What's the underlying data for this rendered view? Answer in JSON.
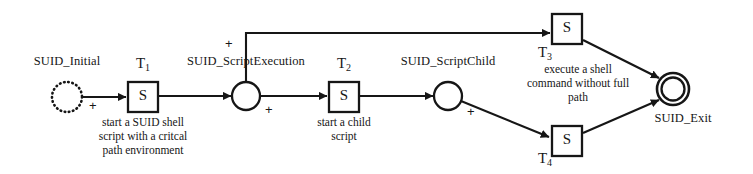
{
  "figure": {
    "kind": "petri-net",
    "title": "",
    "background_color": "#ffffff",
    "stroke_color": "#161616"
  },
  "places": [
    {
      "id": "suid-initial",
      "label": "SUID_Initial",
      "style": "dotted",
      "cx": 67,
      "cy": 97,
      "r": 15,
      "label_x": 67,
      "label_y": 62
    },
    {
      "id": "suid-scriptexecution",
      "label": "SUID_ScriptExecution",
      "style": "solid",
      "cx": 246,
      "cy": 96,
      "r": 14,
      "label_x": 246,
      "label_y": 62
    },
    {
      "id": "suid-scriptchild",
      "label": "SUID_ScriptChild",
      "style": "solid",
      "cx": 448,
      "cy": 96,
      "r": 14,
      "label_x": 448,
      "label_y": 62
    },
    {
      "id": "suid-exit",
      "label": "SUID_Exit",
      "style": "double",
      "cx": 673,
      "cy": 89,
      "r": 16,
      "label_x": 683,
      "label_y": 120
    }
  ],
  "transitions": [
    {
      "id": "t1",
      "name": "T",
      "subscript": "1",
      "inner_label": "S",
      "x": 128,
      "y": 82,
      "w": 30,
      "h": 30,
      "name_x": 143,
      "name_y": 58,
      "caption": [
        "start a SUID shell",
        "script with a critcal",
        "path environment"
      ],
      "caption_x": 143,
      "caption_y": 116
    },
    {
      "id": "t2",
      "name": "T",
      "subscript": "2",
      "inner_label": "S",
      "x": 329,
      "y": 82,
      "w": 30,
      "h": 30,
      "name_x": 344,
      "name_y": 58,
      "caption": [
        "start a child",
        "script"
      ],
      "caption_x": 344,
      "caption_y": 116
    },
    {
      "id": "t3",
      "name": "T",
      "subscript": "3",
      "inner_label": "S",
      "x": 552,
      "y": 14,
      "w": 30,
      "h": 30,
      "name_x": 546,
      "name_y": 48,
      "caption": [
        "execute a shell",
        "command without full",
        "path"
      ],
      "caption_x": 578,
      "caption_y": 63
    },
    {
      "id": "t4",
      "name": "T",
      "subscript": "4",
      "inner_label": "S",
      "x": 552,
      "y": 126,
      "w": 30,
      "h": 30,
      "name_x": 546,
      "name_y": 154,
      "caption": [],
      "caption_x": 578,
      "caption_y": 160
    }
  ],
  "arcs": [
    {
      "id": "initial-to-t1",
      "from": "suid-initial",
      "to": "t1",
      "annotation": "+",
      "ann_x": 92,
      "ann_y": 106
    },
    {
      "id": "t1-to-exec",
      "from": "t1",
      "to": "suid-scriptexecution",
      "annotation": "",
      "ann_x": 0,
      "ann_y": 0
    },
    {
      "id": "exec-to-t3",
      "from": "suid-scriptexecution",
      "to": "t3",
      "annotation": "+",
      "ann_x": 228,
      "ann_y": 45
    },
    {
      "id": "exec-to-t2",
      "from": "suid-scriptexecution",
      "to": "t2",
      "annotation": "+",
      "ann_x": 268,
      "ann_y": 110
    },
    {
      "id": "t2-to-child",
      "from": "t2",
      "to": "suid-scriptchild",
      "annotation": "",
      "ann_x": 0,
      "ann_y": 0
    },
    {
      "id": "child-to-t4",
      "from": "suid-scriptchild",
      "to": "t4",
      "annotation": "+",
      "ann_x": 470,
      "ann_y": 112
    },
    {
      "id": "t3-to-exit",
      "from": "t3",
      "to": "suid-exit",
      "annotation": "",
      "ann_x": 0,
      "ann_y": 0
    },
    {
      "id": "t4-to-exit",
      "from": "t4",
      "to": "suid-exit",
      "annotation": "",
      "ann_x": 0,
      "ann_y": 0
    }
  ]
}
